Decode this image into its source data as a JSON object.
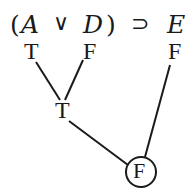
{
  "formula": {
    "open_paren": "(",
    "var_a": "A",
    "or_op": "∨",
    "var_d": "D",
    "close_paren": ")",
    "implies_op": "⊃",
    "var_e": "E"
  },
  "truth_values": {
    "a": "T",
    "d": "F",
    "e": "F",
    "disjunction": "T",
    "main_connective": "F"
  },
  "colors": {
    "ink": "#1a1a1a",
    "background": "#ffffff"
  }
}
